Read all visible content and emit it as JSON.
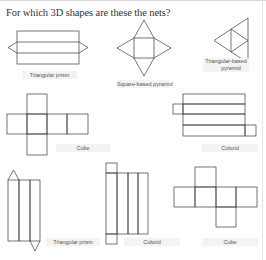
{
  "worksheet": {
    "question": "For which 3D shapes are these the nets?",
    "nets": [
      {
        "id": "net-1",
        "shape": "triangular-prism-net",
        "answer": "Triangular prism"
      },
      {
        "id": "net-2",
        "shape": "square-based-pyramid-net",
        "answer": "Square-based pyramid"
      },
      {
        "id": "net-3",
        "shape": "triangular-based-pyramid-net",
        "answer_line1": "Triangular-based",
        "answer_line2": "pyramid"
      },
      {
        "id": "net-4",
        "shape": "cube-net",
        "answer": "Cube"
      },
      {
        "id": "net-5",
        "shape": "cuboid-net",
        "answer": "Cuboid"
      },
      {
        "id": "net-6",
        "shape": "triangular-prism-net",
        "answer": "Triangular prism"
      },
      {
        "id": "net-7",
        "shape": "cuboid-net",
        "answer": "Cuboid"
      },
      {
        "id": "net-8",
        "shape": "cube-net",
        "answer": "Cube"
      }
    ]
  },
  "colors": {
    "line": "#3a3a3a",
    "label_bg": "#f3f3f3",
    "text": "#333333"
  }
}
